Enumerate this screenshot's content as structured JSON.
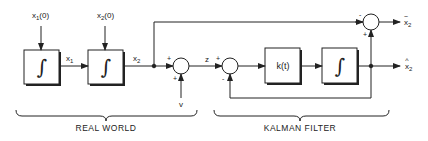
{
  "diagram": {
    "colors": {
      "line": "#222222",
      "background": "#ffffff"
    },
    "inputs": {
      "x1_init": {
        "base": "x",
        "sub": "1",
        "suffix": "(0)"
      },
      "x2_init": {
        "base": "x",
        "sub": "2",
        "suffix": "(0)"
      },
      "noise": "v"
    },
    "signals": {
      "x1": {
        "base": "x",
        "sub": "1"
      },
      "x2": {
        "base": "x",
        "sub": "2"
      },
      "z": "z",
      "x2_hat": {
        "base": "x",
        "sub": "2",
        "accent": "^"
      },
      "x2_tilde": {
        "base": "x",
        "sub": "2",
        "accent": "~"
      }
    },
    "blocks": [
      {
        "id": "integrator-1",
        "glyph": "∫"
      },
      {
        "id": "integrator-2",
        "glyph": "∫"
      },
      {
        "id": "gain",
        "label": "k(t)"
      },
      {
        "id": "integrator-3",
        "glyph": "∫"
      }
    ],
    "summing_junctions": [
      {
        "id": "sum-measurement",
        "signs": {
          "left": "+",
          "bottom": "+"
        }
      },
      {
        "id": "sum-innovation",
        "signs": {
          "left": "+",
          "bottom": "-"
        }
      },
      {
        "id": "sum-error",
        "signs": {
          "left": "-",
          "bottom": "+"
        }
      }
    ],
    "groups": [
      {
        "id": "real-world",
        "label": "REAL WORLD"
      },
      {
        "id": "kalman-filter",
        "label": "KALMAN FILTER"
      }
    ]
  }
}
